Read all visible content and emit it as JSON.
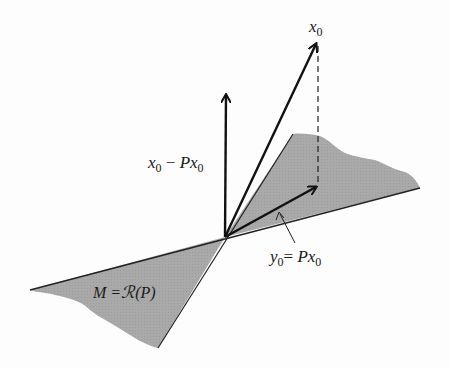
{
  "diagram": {
    "colors": {
      "background": "#fdfdfd",
      "plane_fill": "#a9a9a9",
      "ink": "#111111"
    },
    "labels": {
      "x0": {
        "main": "x",
        "sub": "0"
      },
      "residual": {
        "a": "x",
        "a_sub": "0",
        "op": " − ",
        "b": "Px",
        "b_sub": "0"
      },
      "projection": {
        "a": "y",
        "a_sub": "0",
        "op": "= ",
        "b": "Px",
        "b_sub": "0"
      },
      "subspace": {
        "text": "M =",
        "script": "ℛ",
        "paren": "(P)"
      }
    },
    "vectors": [
      {
        "name": "x0",
        "from": [
          225,
          237
        ],
        "to": [
          317,
          42
        ]
      },
      {
        "name": "x0 - Px0",
        "from": [
          225,
          237
        ],
        "to": [
          226,
          93
        ]
      },
      {
        "name": "y0 = Px0",
        "from": [
          225,
          237
        ],
        "to": [
          318,
          186
        ]
      }
    ],
    "dashed_projection_line": {
      "from": [
        318,
        45
      ],
      "to": [
        318,
        186
      ]
    },
    "plane": {
      "name": "M = R(P)"
    }
  }
}
